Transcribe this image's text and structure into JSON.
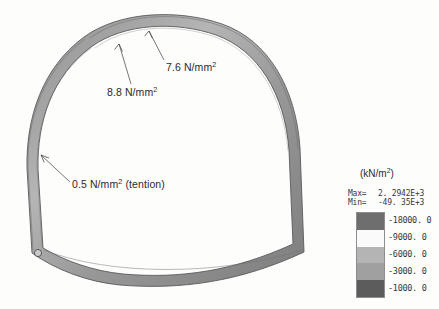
{
  "figure": {
    "background_color": "#fdfdfc",
    "lining_fill_color": "#9a9a9a",
    "lining_stroke_color": "#5a5a5a"
  },
  "annotations": [
    {
      "id": "annot-76",
      "text": "7.6 N/mm",
      "superscript": "2",
      "target": "arch crown right"
    },
    {
      "id": "annot-88",
      "text": "8.8 N/mm",
      "superscript": "2",
      "target": "arch shoulder left"
    },
    {
      "id": "annot-05",
      "text": "0.5 N/mm",
      "superscript": "2",
      "suffix": " (tention)",
      "target": "left side wall"
    }
  ],
  "legend": {
    "unit_prefix": "(kN/m",
    "unit_superscript": "2",
    "unit_suffix": ")",
    "max_label": "Max=",
    "max_value": "2. 2942E+3",
    "min_label": "Min=",
    "min_value": "-49. 35E+3",
    "bands": [
      {
        "value": "-18000. 0",
        "color": "#6e6e6e"
      },
      {
        "value": "-9000. 0",
        "color": "#fafafa"
      },
      {
        "value": "-6000. 0",
        "color": "#b4b4b4"
      },
      {
        "value": "-3000. 0",
        "color": "#a0a0a0"
      },
      {
        "value": "-1000. 0",
        "color": "#5c5c5c"
      }
    ]
  }
}
